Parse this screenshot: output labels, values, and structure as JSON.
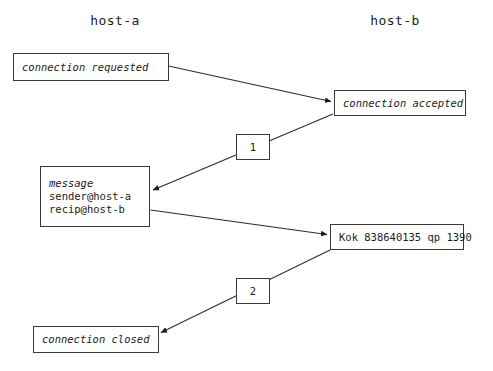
{
  "diagram": {
    "background_color": "#ffffff",
    "stroke_color": "#3a3a3a",
    "text_color": "#1c1c1c",
    "columns": [
      {
        "id": "host-a",
        "label": "host-a"
      },
      {
        "id": "host-b",
        "label": "host-b"
      }
    ],
    "nodes": [
      {
        "id": "connection-requested",
        "column": "host-a",
        "style": "italic",
        "lines": [
          "connection requested"
        ]
      },
      {
        "id": "connection-accepted",
        "column": "host-b",
        "style": "italic",
        "lines": [
          "connection accepted"
        ]
      },
      {
        "id": "message-envelope",
        "column": "host-a",
        "style": "mixed",
        "lines": [
          "message",
          "sender@host-a",
          "recip@host-b"
        ],
        "line_styles": [
          "italic",
          "regular",
          "regular"
        ]
      },
      {
        "id": "kok-response",
        "column": "host-b",
        "style": "regular",
        "lines": [
          "Kok 838640135 qp 1390"
        ]
      },
      {
        "id": "connection-closed",
        "column": "host-a",
        "style": "italic",
        "lines": [
          "connection closed"
        ]
      }
    ],
    "step_tags": [
      {
        "id": "step-1",
        "label": "1"
      },
      {
        "id": "step-2",
        "label": "2"
      }
    ]
  }
}
